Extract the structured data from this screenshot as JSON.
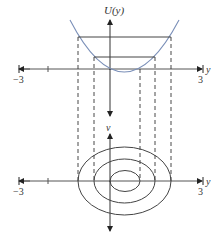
{
  "figure": {
    "top_panel": {
      "ylabel": "U(y)",
      "xlabel": "y",
      "x_min_label": "−3",
      "x_max_label": "3",
      "curve": "parabola",
      "curve_color": "#7a8fb8",
      "energy_levels": 2
    },
    "bottom_panel": {
      "ylabel": "v",
      "xlabel": "y",
      "x_min_label": "−3",
      "x_max_label": "3",
      "contours": 3
    },
    "colors": {
      "axis": "#333333",
      "curve": "#7a8fb8",
      "dashed": "#333333"
    }
  }
}
